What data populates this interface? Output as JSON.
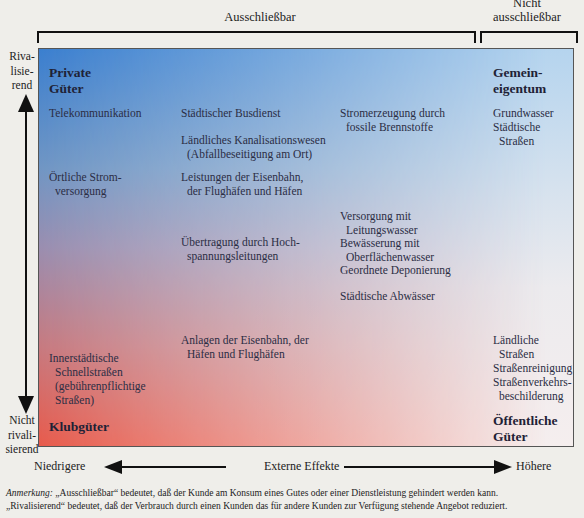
{
  "header": {
    "excludable": "Ausschließbar",
    "non_excludable_line1": "Nicht",
    "non_excludable_line2": "ausschließbar"
  },
  "y_axis": {
    "top_label": [
      "Riva-",
      "lisie-",
      "rend"
    ],
    "bottom_label": [
      "Nicht",
      "rivali-",
      "sierend"
    ]
  },
  "x_axis": {
    "left_label": "Niedrigere",
    "center_label": "Externe Effekte",
    "right_label": "Höhere"
  },
  "corners": {
    "top_left": [
      "Private",
      "Güter"
    ],
    "top_right": [
      "Gemein-",
      "eigentum"
    ],
    "bottom_left": "Klubgüter",
    "bottom_right": [
      "Öffentliche",
      "Güter"
    ]
  },
  "colors": {
    "top_left": "#3b7fcf",
    "bottom_left": "#e85b4c",
    "top_right": "#b5d4ee",
    "bottom_right": "#f5eeee",
    "background": "#efeeea"
  },
  "items": {
    "telekommunikation": "Telekommunikation",
    "oertliche_strom": [
      "Örtliche Strom-",
      "versorgung"
    ],
    "innerstaedtische": [
      "Innerstädtische",
      "Schnellstraßen",
      "(gebührenpflichtige",
      "Straßen)"
    ],
    "busdienst": "Städtischer Busdienst",
    "kanalisation": [
      "Ländliches Kanalisationswesen",
      "(Abfallbeseitigung am Ort)"
    ],
    "eisenbahn_leistungen": [
      "Leistungen der Eisenbahn,",
      "der Flughäfen und Häfen"
    ],
    "hochspannung": [
      "Übertragung durch Hoch-",
      "spannungsleitungen"
    ],
    "anlagen": [
      "Anlagen der Eisenbahn, der",
      "Häfen und Flughäfen"
    ],
    "stromerzeugung": [
      "Stromerzeugung durch",
      "fossile Brennstoffe"
    ],
    "leitungswasser": [
      "Versorgung mit",
      "Leitungswasser"
    ],
    "bewaesserung": [
      "Bewässerung mit",
      "Oberflächenwasser"
    ],
    "deponierung": "Geordnete Deponierung",
    "abwaesser": "Städtische Abwässer",
    "grundwasser": "Grundwasser",
    "staedtische_strassen": [
      "Städtische",
      "Straßen"
    ],
    "laendliche_strassen": [
      "Ländliche",
      "Straßen"
    ],
    "strassenreinigung": "Straßenreinigung",
    "beschilderung": [
      "Straßenverkehrs-",
      "beschilderung"
    ]
  },
  "note": {
    "label": "Anmerkung:",
    "line1": " „Ausschließbar“ bedeutet, daß der Kunde am Konsum eines Gutes oder einer Dienstleistung gehindert werden kann.",
    "line2": "„Rivalisierend“ bedeutet, daß der Verbrauch durch einen Kunden das für andere Kunden zur Verfügung stehende Angebot reduziert."
  }
}
